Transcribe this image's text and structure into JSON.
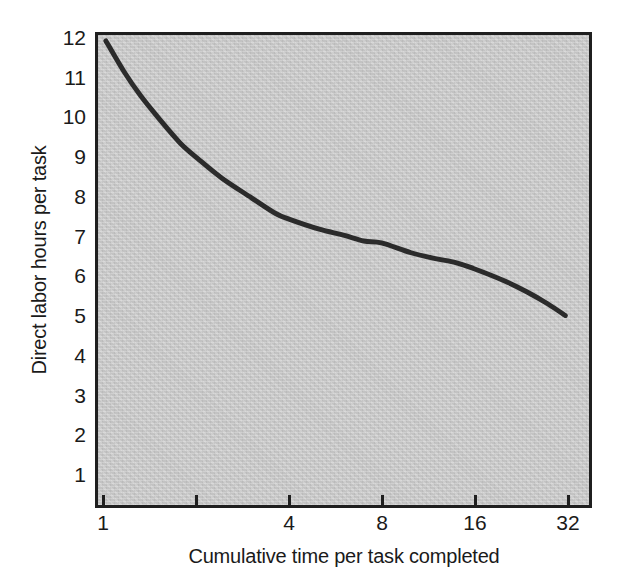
{
  "chart_data": {
    "type": "line",
    "title": "",
    "xlabel": "Cumulative time per task completed",
    "ylabel": "Direct labor hours per task",
    "xscale": "log2",
    "xlim": [
      1,
      32
    ],
    "ylim": [
      0,
      12.2
    ],
    "grid": false,
    "legend": null,
    "plot_background_color": "#c9c9c9",
    "line_color": "#2b2b2b",
    "line_width_px": 5,
    "x_ticks": [
      {
        "value": 1,
        "label": "1",
        "labeled": true
      },
      {
        "value": 2,
        "label": "",
        "labeled": false
      },
      {
        "value": 4,
        "label": "4",
        "labeled": true
      },
      {
        "value": 8,
        "label": "8",
        "labeled": true
      },
      {
        "value": 16,
        "label": "16",
        "labeled": true
      },
      {
        "value": 32,
        "label": "32",
        "labeled": true
      }
    ],
    "y_ticks": [
      {
        "value": 12,
        "label": "12"
      },
      {
        "value": 11,
        "label": "11"
      },
      {
        "value": 10,
        "label": "10"
      },
      {
        "value": 9,
        "label": "9"
      },
      {
        "value": 8,
        "label": "8"
      },
      {
        "value": 7,
        "label": "7"
      },
      {
        "value": 6,
        "label": "6"
      },
      {
        "value": 5,
        "label": "5"
      },
      {
        "value": 4,
        "label": "4"
      },
      {
        "value": 3,
        "label": "3"
      },
      {
        "value": 2,
        "label": "2"
      },
      {
        "value": 1,
        "label": "1"
      }
    ],
    "series": [
      {
        "name": "Learning curve",
        "x": [
          1,
          1.15,
          1.3,
          1.5,
          1.75,
          2,
          2.4,
          3,
          3.6,
          4,
          5,
          6,
          7,
          8,
          10,
          12,
          14,
          16,
          20,
          24,
          28,
          32
        ],
        "y": [
          12.0,
          11.2,
          10.6,
          10.0,
          9.4,
          9.0,
          8.5,
          8.0,
          7.6,
          7.45,
          7.2,
          7.05,
          6.9,
          6.85,
          6.6,
          6.45,
          6.35,
          6.2,
          5.9,
          5.6,
          5.3,
          5.0
        ]
      }
    ]
  }
}
